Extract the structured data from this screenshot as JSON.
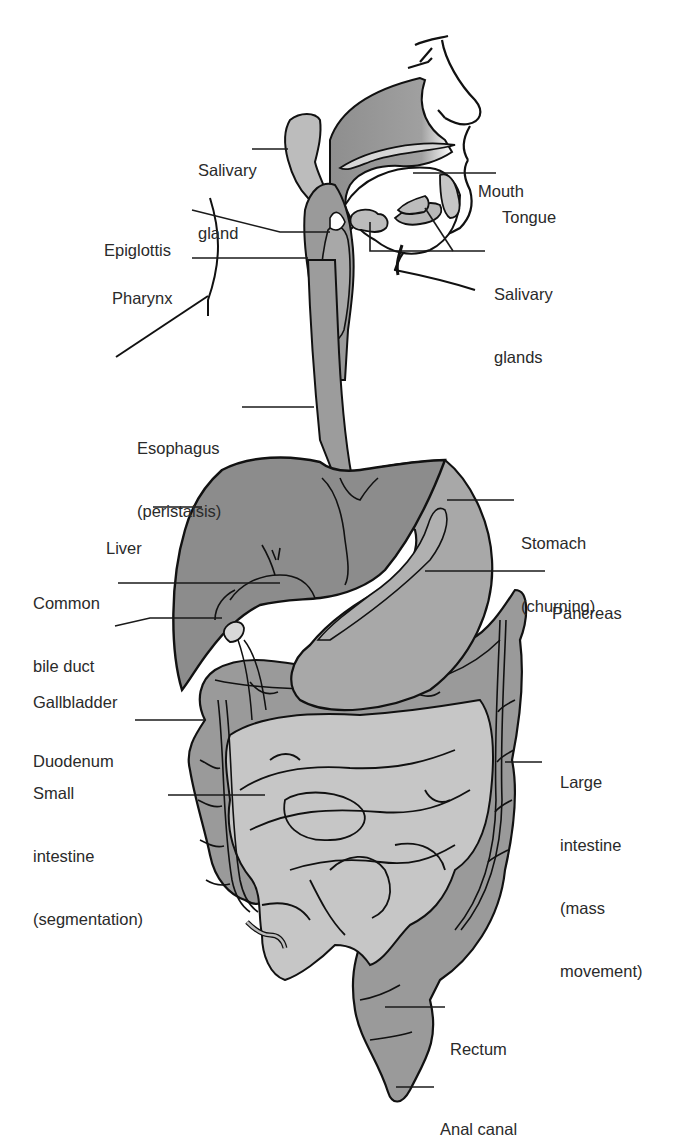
{
  "colors": {
    "outline": "#111111",
    "dark_organ": "#8a8a8a",
    "mid_organ": "#a6a6a6",
    "light_organ": "#c4c4c4",
    "leader_line": "#1a1a1a",
    "label_text": "#2a2a2a"
  },
  "labels": {
    "salivary_gland": [
      "Salivary",
      "gland"
    ],
    "mouth": [
      "Mouth"
    ],
    "tongue": [
      "Tongue"
    ],
    "epiglottis": [
      "Epiglottis"
    ],
    "pharynx": [
      "Pharynx"
    ],
    "salivary_glands": [
      "Salivary",
      "glands"
    ],
    "esophagus": [
      "Esophagus",
      "(peristalsis)"
    ],
    "liver": [
      "Liver"
    ],
    "stomach": [
      "Stomach",
      "(churning)"
    ],
    "common_bile_duct": [
      "Common",
      "bile duct"
    ],
    "pancreas": [
      "Pancreas"
    ],
    "gallbladder": [
      "Gallbladder"
    ],
    "duodenum": [
      "Duodenum"
    ],
    "small_intestine": [
      "Small",
      "intestine",
      "(segmentation)"
    ],
    "large_intestine": [
      "Large",
      "intestine",
      "(mass",
      "movement)"
    ],
    "rectum": [
      "Rectum"
    ],
    "anal_canal": [
      "Anal canal"
    ]
  }
}
